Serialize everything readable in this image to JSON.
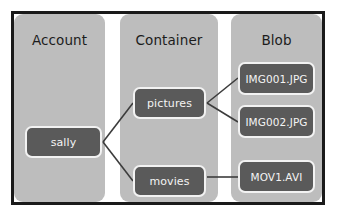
{
  "diagram": {
    "frame": {
      "border_color": "#1a1a1a"
    },
    "columns": [
      {
        "id": "account",
        "label": "Account",
        "fill": "#bdbdbd"
      },
      {
        "id": "container",
        "label": "Container",
        "fill": "#bdbdbd"
      },
      {
        "id": "blob",
        "label": "Blob",
        "fill": "#bdbdbd"
      }
    ],
    "nodes": [
      {
        "id": "sally",
        "label": "sally",
        "column": "account",
        "fill": "#5a5a5a",
        "text_color": "#f4f4f4"
      },
      {
        "id": "pictures",
        "label": "pictures",
        "column": "container",
        "fill": "#5a5a5a",
        "text_color": "#f4f4f4"
      },
      {
        "id": "movies",
        "label": "movies",
        "column": "container",
        "fill": "#5a5a5a",
        "text_color": "#f4f4f4"
      },
      {
        "id": "img001",
        "label": "IMG001.JPG",
        "column": "blob",
        "fill": "#5a5a5a",
        "text_color": "#f4f4f4"
      },
      {
        "id": "img002",
        "label": "IMG002.JPG",
        "column": "blob",
        "fill": "#5a5a5a",
        "text_color": "#f4f4f4"
      },
      {
        "id": "mov1",
        "label": "MOV1.AVI",
        "column": "blob",
        "fill": "#5a5a5a",
        "text_color": "#f4f4f4"
      }
    ],
    "edges": [
      {
        "from": "sally",
        "to": "pictures",
        "shape": "diagonal-up",
        "color": "#3c3c3c"
      },
      {
        "from": "sally",
        "to": "movies",
        "shape": "diagonal-down",
        "color": "#3c3c3c"
      },
      {
        "from": "pictures",
        "to": "img001",
        "shape": "diagonal-up",
        "color": "#3c3c3c"
      },
      {
        "from": "pictures",
        "to": "img002",
        "shape": "diagonal-down",
        "color": "#3c3c3c"
      },
      {
        "from": "movies",
        "to": "mov1",
        "shape": "horizontal",
        "color": "#3c3c3c"
      }
    ]
  }
}
